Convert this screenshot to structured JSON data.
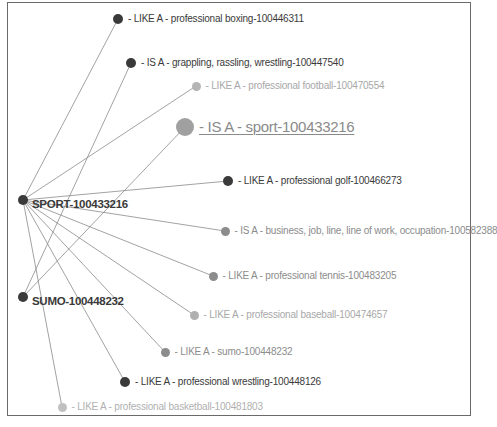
{
  "graph": {
    "hubs": [
      {
        "id": "sport",
        "label": "SPORT-100433216",
        "x": 23,
        "y": 200,
        "r": 5,
        "color": "#3a3a3a"
      },
      {
        "id": "sumo",
        "label": "SUMO-100448232",
        "x": 23,
        "y": 297,
        "r": 5,
        "color": "#3a3a3a"
      }
    ],
    "nodes": [
      {
        "id": "boxing",
        "label": "- LIKE A - professional boxing-100446311",
        "x": 118,
        "y": 19,
        "r": 5,
        "color": "#3a3a3a",
        "text": "#3a3a3a",
        "from": "sport"
      },
      {
        "id": "grappling",
        "label": "- IS A - grappling, rassling, wrestling-100447540",
        "x": 131,
        "y": 63,
        "r": 5,
        "color": "#3a3a3a",
        "text": "#3a3a3a",
        "from": "sumo"
      },
      {
        "id": "football",
        "label": "- LIKE A - professional football-100470554",
        "x": 196,
        "y": 86,
        "r": 4.5,
        "color": "#b4b4b4",
        "text": "#a8a8a8",
        "from": "sport"
      },
      {
        "id": "sport-isa",
        "label": "- IS A - sport-100433216",
        "x": 185,
        "y": 127,
        "r": 9,
        "color": "#a0a0a0",
        "text": "#8a8a8a",
        "from": "sumo",
        "focus": true
      },
      {
        "id": "golf",
        "label": "- LIKE A - professional golf-100466273",
        "x": 228,
        "y": 181,
        "r": 5,
        "color": "#3a3a3a",
        "text": "#3a3a3a",
        "from": "sport"
      },
      {
        "id": "business",
        "label": "- IS A - business, job, line, line of work, occupation-100582388",
        "x": 225,
        "y": 231,
        "r": 4.5,
        "color": "#8c8c8c",
        "text": "#8c8c8c",
        "from": "sport"
      },
      {
        "id": "tennis",
        "label": "- LIKE A - professional tennis-100483205",
        "x": 213,
        "y": 276,
        "r": 4.5,
        "color": "#8c8c8c",
        "text": "#8c8c8c",
        "from": "sport"
      },
      {
        "id": "baseball",
        "label": "- LIKE A - professional baseball-100474657",
        "x": 194,
        "y": 315,
        "r": 4.5,
        "color": "#b0b0b0",
        "text": "#a8a8a8",
        "from": "sport"
      },
      {
        "id": "sumo-like",
        "label": "- LIKE A - sumo-100448232",
        "x": 165,
        "y": 352,
        "r": 4.5,
        "color": "#8c8c8c",
        "text": "#8c8c8c",
        "from": "sport"
      },
      {
        "id": "wrestling",
        "label": "- LIKE A - professional wrestling-100448126",
        "x": 125,
        "y": 382,
        "r": 5,
        "color": "#3a3a3a",
        "text": "#3a3a3a",
        "from": "sport"
      },
      {
        "id": "basketball",
        "label": "- LIKE A - professional basketball-100481803",
        "x": 62,
        "y": 407,
        "r": 4.5,
        "color": "#c0c0c0",
        "text": "#b0b0b0",
        "from": "sport"
      }
    ],
    "edge_color": "#8a8a8a"
  }
}
